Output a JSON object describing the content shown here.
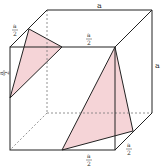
{
  "diagram": {
    "type": "cube-sections",
    "labels": {
      "top_edge": "a",
      "right_edge": "a",
      "half": "a",
      "half_den": "2"
    },
    "colors": {
      "edge": "#222222",
      "hidden_edge": "#777777",
      "fill": "#f3c9cd"
    }
  }
}
